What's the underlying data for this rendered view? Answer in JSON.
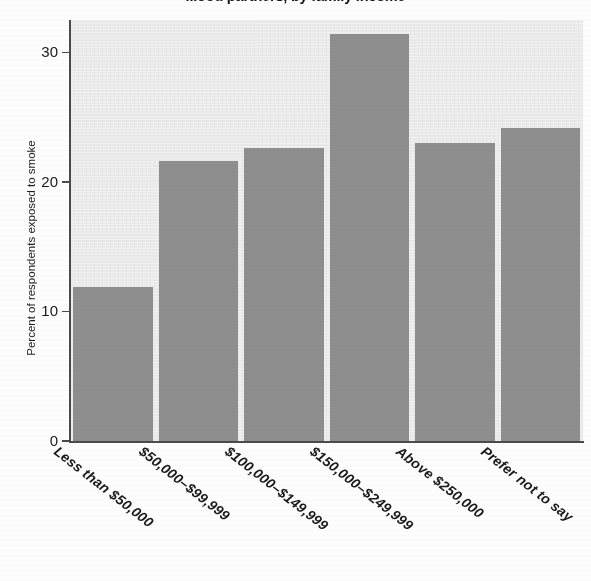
{
  "chart_data": {
    "type": "bar",
    "title": "...ood partners, by family income",
    "title_truncated": true,
    "xlabel": "",
    "ylabel": "Percent of respondents exposed to smoke",
    "categories": [
      "Less than $50,000",
      "$50,000–$99,999",
      "$100,000–$149,999",
      "$150,000–$249,999",
      "Above $250,000",
      "Prefer not to say"
    ],
    "values": [
      11.9,
      21.6,
      22.6,
      31.4,
      23.0,
      24.2
    ],
    "ylim": [
      0,
      32.5
    ],
    "yticks": [
      0,
      10,
      20,
      30
    ],
    "ytick_labels": [
      "0",
      "10",
      "20",
      "30"
    ],
    "grid": false,
    "legend": null,
    "bar_color": "#8e8e8e",
    "plot_background": "#ebebeb",
    "axis_color": "#4a4a4a"
  },
  "axis": {
    "y_title": "Percent of respondents exposed to smoke"
  }
}
